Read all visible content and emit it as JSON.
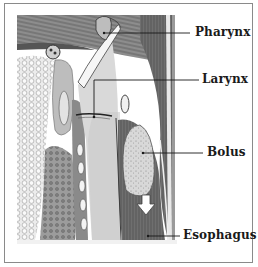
{
  "diagram": {
    "labels": [
      {
        "id": "pharynx",
        "text": "Pharynx"
      },
      {
        "id": "larynx",
        "text": "Larynx"
      },
      {
        "id": "bolus",
        "text": "Bolus"
      },
      {
        "id": "esophagus",
        "text": "Esophagus"
      }
    ],
    "arrow": {
      "direction": "down",
      "meaning": "bolus movement"
    },
    "colors": {
      "frame": "#8a8a8a",
      "ink": "#1a1a1a",
      "muscle": "#6e6e6e",
      "tissue_light": "#cfcfcf",
      "background": "#ffffff"
    }
  }
}
